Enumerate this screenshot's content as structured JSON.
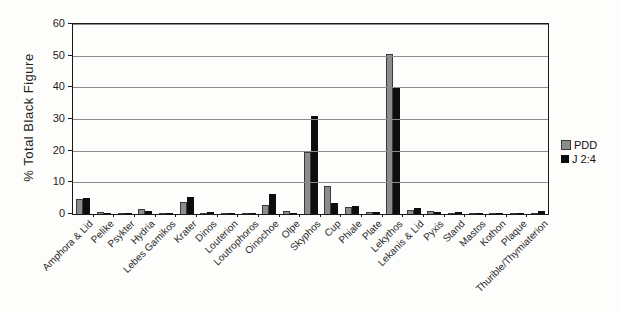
{
  "chart_data": {
    "type": "bar",
    "title": "",
    "xlabel": "",
    "ylabel": "% Total Black Figure",
    "ylim": [
      0,
      60
    ],
    "ytick_step": 10,
    "grid": true,
    "legend_position": "right",
    "categories": [
      "Amphora & Lid",
      "Pelike",
      "Psykter",
      "Hydria",
      "Lebes Gamikos",
      "Krater",
      "Dinos",
      "Louterion",
      "Loutrophoros",
      "Oinochoe",
      "Olpe",
      "Skyphos",
      "Cup",
      "Phiale",
      "Plate",
      "Lekythos",
      "Lekanis & Lid",
      "Pyxis",
      "Stand",
      "Mastos",
      "Kothon",
      "Plaque",
      "Thurible/Thymiaterion"
    ],
    "series": [
      {
        "name": "PDD",
        "color": "#8c8c8c",
        "values": [
          4.8,
          0.6,
          0.2,
          1.5,
          0.4,
          3.8,
          0.2,
          0.3,
          0.2,
          2.8,
          1.0,
          19.5,
          8.8,
          2.2,
          0.5,
          50.6,
          1.2,
          0.8,
          0.3,
          0.2,
          0.1,
          0.2,
          0.1
        ]
      },
      {
        "name": "J 2:4",
        "color": "#0d0d0d",
        "values": [
          5.0,
          0.2,
          0.1,
          0.9,
          0.1,
          5.5,
          0.7,
          0.1,
          0.4,
          6.4,
          0.2,
          30.8,
          3.4,
          2.5,
          0.7,
          39.7,
          1.8,
          0.5,
          0.6,
          0.3,
          0.3,
          0.3,
          0.8
        ]
      }
    ],
    "ytick_labels": [
      "0",
      "10",
      "20",
      "30",
      "40",
      "50",
      "60"
    ]
  }
}
